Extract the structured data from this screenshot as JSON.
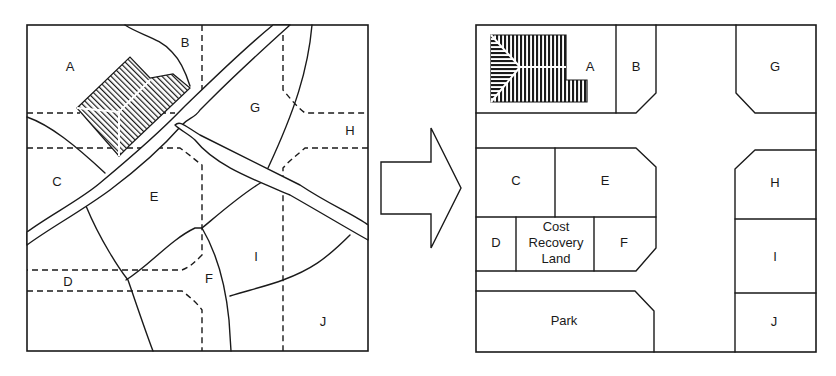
{
  "figure": {
    "before_map": {
      "description": "Original irregular land parcels before readjustment",
      "parcels": [
        {
          "id": "A",
          "label": "A"
        },
        {
          "id": "B",
          "label": "B"
        },
        {
          "id": "C",
          "label": "C"
        },
        {
          "id": "D",
          "label": "D"
        },
        {
          "id": "E",
          "label": "E"
        },
        {
          "id": "F",
          "label": "F"
        },
        {
          "id": "G",
          "label": "G"
        },
        {
          "id": "H",
          "label": "H"
        },
        {
          "id": "I",
          "label": "I"
        },
        {
          "id": "J",
          "label": "J"
        }
      ]
    },
    "arrow": {
      "direction": "right"
    },
    "after_map": {
      "description": "Readjusted regular parcels with road grid",
      "parcels": [
        {
          "id": "A",
          "label": "A"
        },
        {
          "id": "B",
          "label": "B"
        },
        {
          "id": "G",
          "label": "G"
        },
        {
          "id": "C",
          "label": "C"
        },
        {
          "id": "E",
          "label": "E"
        },
        {
          "id": "H",
          "label": "H"
        },
        {
          "id": "D",
          "label": "D"
        },
        {
          "id": "cost",
          "label_lines": [
            "Cost",
            "Recovery",
            "Land"
          ]
        },
        {
          "id": "F",
          "label": "F"
        },
        {
          "id": "I",
          "label": "I"
        },
        {
          "id": "park",
          "label": "Park"
        },
        {
          "id": "J",
          "label": "J"
        }
      ]
    }
  }
}
